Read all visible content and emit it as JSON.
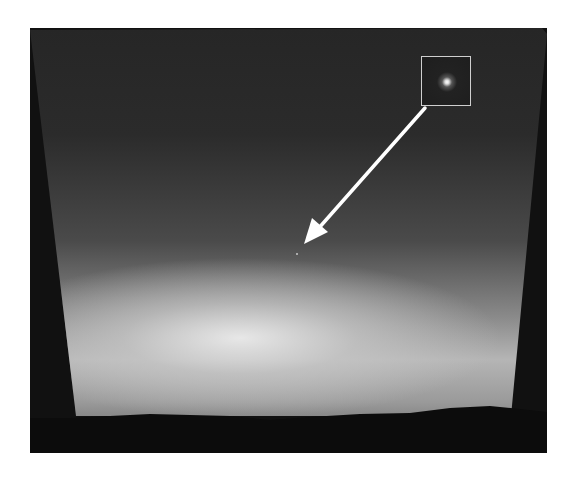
{
  "image": {
    "description": "Grayscale twilight sky photograph with a bright glow near the horizon, dark terrain silhouette at the bottom, a boxed magnified inset in the upper right, and a white arrow pointing to a faint point of light in the sky",
    "colors": {
      "page_background": "#ffffff",
      "frame_background": "#111111",
      "sky_top": "#262626",
      "glow": "#ebebeb",
      "ground": "#0c0c0c",
      "arrow": "#ffffff",
      "inset_border": "#cfcfcf"
    },
    "annotations": {
      "inset_box": {
        "x": 421,
        "y": 56,
        "width": 50,
        "height": 50,
        "content": "magnified view of a point of light"
      },
      "arrow": {
        "from": [
          425,
          108
        ],
        "to": [
          305,
          243
        ],
        "target": "faint point of light in sky"
      }
    }
  }
}
